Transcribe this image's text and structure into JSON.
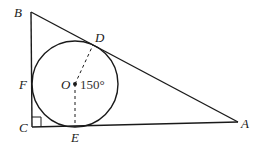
{
  "diagram": {
    "type": "geometry",
    "colors": {
      "line": "#1a1a1a",
      "background": "#ffffff"
    },
    "points": {
      "A": {
        "label": "A",
        "x": 238,
        "y": 122
      },
      "B": {
        "label": "B",
        "x": 31,
        "y": 12
      },
      "C": {
        "label": "C",
        "x": 32,
        "y": 127
      },
      "O": {
        "label": "O",
        "x": 75,
        "y": 84
      },
      "D": {
        "label": "D",
        "x": 93,
        "y": 45
      },
      "E": {
        "label": "E",
        "x": 75,
        "y": 127
      },
      "F": {
        "label": "F",
        "x": 32,
        "y": 84
      }
    },
    "circle": {
      "center": "O",
      "radius": 43
    },
    "angle_label": "150°",
    "right_angle_at": "C",
    "dashed_segments": [
      "OD",
      "OE"
    ]
  }
}
